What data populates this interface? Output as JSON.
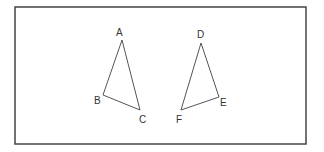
{
  "figure": {
    "frame": {
      "x": 15,
      "y": 7,
      "width": 291,
      "height": 137,
      "stroke": "#444444"
    },
    "triangles": [
      {
        "name": "ABC",
        "vertices": [
          {
            "label": "A",
            "x": 122,
            "y": 40,
            "lx": 116,
            "ly": 36
          },
          {
            "label": "B",
            "x": 103,
            "y": 95,
            "lx": 94,
            "ly": 104
          },
          {
            "label": "C",
            "x": 140,
            "y": 110,
            "lx": 139,
            "ly": 123
          }
        ]
      },
      {
        "name": "DEF",
        "vertices": [
          {
            "label": "D",
            "x": 201,
            "y": 43,
            "lx": 197,
            "ly": 38
          },
          {
            "label": "E",
            "x": 219,
            "y": 97,
            "lx": 220,
            "ly": 106
          },
          {
            "label": "F",
            "x": 181,
            "y": 110,
            "lx": 176,
            "ly": 123
          }
        ]
      }
    ],
    "line_color": "#555555"
  }
}
